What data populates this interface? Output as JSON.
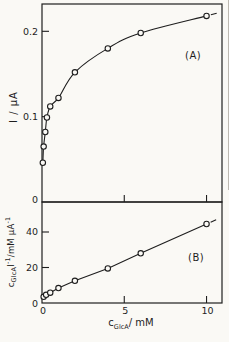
{
  "figure": {
    "background": "#faf9f5",
    "ink": "#1e1e1e",
    "panel_a_label": "(A)",
    "panel_b_label": "(B)",
    "panel_a_y_label": "I / μA",
    "panel_b_y_label": {
      "c": "c",
      "sub": "GlcA",
      "i": "I",
      "sup1": "-1",
      "unit": "/mM μA",
      "sup2": "-1"
    },
    "x_axis_label": {
      "c": "c",
      "sub": "GlcA",
      "rest": "/ mM"
    }
  },
  "chart_data": [
    {
      "type": "line",
      "panel": "A",
      "title": "",
      "xlabel": "c_GlcA / mM",
      "ylabel": "I / μA",
      "xlim": [
        0,
        10.94
      ],
      "ylim": [
        0,
        0.232
      ],
      "xticks": [
        5,
        10
      ],
      "xtick_labels": [
        "",
        ""
      ],
      "yticks": [
        0,
        0.1,
        0.2
      ],
      "ytick_labels": [
        "0",
        "0.1",
        "0.2"
      ],
      "smooth": true,
      "trailing_dash": true,
      "x": [
        0.05,
        0.1,
        0.2,
        0.3,
        0.5,
        1,
        2,
        4,
        6,
        10
      ],
      "y": [
        0.046,
        0.065,
        0.082,
        0.099,
        0.112,
        0.122,
        0.152,
        0.18,
        0.198,
        0.218
      ]
    },
    {
      "type": "scatter",
      "panel": "B",
      "title": "",
      "xlabel": "c_GlcA / mM",
      "ylabel": "c_GlcA I^-1 / mM μA^-1",
      "xlim": [
        0,
        10.94
      ],
      "ylim": [
        0,
        56.9
      ],
      "xticks": [
        0,
        5,
        10
      ],
      "xtick_labels": [
        "0",
        "5",
        "10"
      ],
      "yticks": [
        0,
        20,
        40
      ],
      "ytick_labels": [
        "0",
        "20",
        "40"
      ],
      "smooth": false,
      "trailing_dash": true,
      "x": [
        0.1,
        0.25,
        0.5,
        1,
        2,
        4,
        6,
        10
      ],
      "y": [
        3.5,
        4.6,
        5.8,
        8.4,
        12.5,
        19.5,
        28,
        44.5
      ]
    }
  ]
}
